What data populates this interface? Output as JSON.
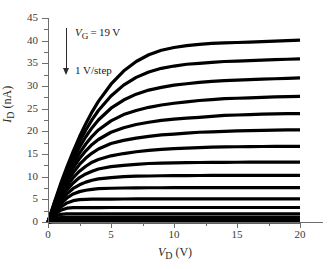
{
  "figure": {
    "background": "#ffffff",
    "curve_color": "#000000",
    "axis_color": "#6d6d6d"
  },
  "axes": {
    "ylabel_html": "<i>I</i><sub>D</sub> (nA)",
    "xlabel_html": "<i>V</i><sub>D</sub> (V)",
    "y_ticks": [
      "0",
      "5",
      "10",
      "15",
      "20",
      "25",
      "30",
      "35",
      "40",
      "45"
    ],
    "x_ticks": [
      "0",
      "5",
      "10",
      "15",
      "20"
    ]
  },
  "annotation": {
    "vg_html": "<i>V</i><sub>G</sub>&thinsp;=&thinsp;19&thinsp;V",
    "step_html": "1 V/step",
    "arrow": "down-arrow"
  },
  "chart_data": {
    "type": "line",
    "title": "",
    "xlabel": "V_D (V)",
    "ylabel": "I_D (nA)",
    "xlim": [
      0,
      20
    ],
    "ylim": [
      0,
      45
    ],
    "xticks": [
      0,
      5,
      10,
      15,
      20
    ],
    "yticks": [
      0,
      5,
      10,
      15,
      20,
      25,
      30,
      35,
      40,
      45
    ],
    "grid": false,
    "legend": "none",
    "annotations": [
      {
        "text": "V_G = 19 V",
        "x": 2.2,
        "y": 40.5
      },
      {
        "text": "1 V/step",
        "x": 2.2,
        "y": 33.5
      }
    ],
    "x": [
      0,
      0.5,
      1,
      1.5,
      2,
      2.5,
      3,
      3.5,
      4,
      5,
      6,
      7,
      8,
      9,
      10,
      11,
      12,
      13,
      14,
      15,
      16,
      17,
      18,
      19,
      20
    ],
    "series": [
      {
        "name": "V_G = 19 V",
        "saturation": 40.1,
        "values": [
          0,
          4.3,
          8.4,
          12.1,
          15.6,
          18.8,
          21.7,
          24.3,
          26.6,
          30.4,
          33.3,
          35.4,
          36.9,
          37.9,
          38.5,
          38.9,
          39.2,
          39.4,
          39.5,
          39.6,
          39.7,
          39.8,
          39.9,
          40.0,
          40.1
        ]
      },
      {
        "name": "V_G = 18 V",
        "saturation": 36.0,
        "values": [
          0,
          4.1,
          8.0,
          11.6,
          14.8,
          17.7,
          20.3,
          22.6,
          24.6,
          27.8,
          30.2,
          31.9,
          33.1,
          33.9,
          34.4,
          34.8,
          35.0,
          35.2,
          35.4,
          35.5,
          35.6,
          35.7,
          35.8,
          35.9,
          36.0
        ]
      },
      {
        "name": "V_G = 17 V",
        "saturation": 31.8,
        "values": [
          0,
          3.9,
          7.6,
          10.9,
          13.9,
          16.5,
          18.8,
          20.8,
          22.5,
          25.1,
          26.9,
          28.2,
          29.1,
          29.7,
          30.2,
          30.5,
          30.8,
          31.0,
          31.2,
          31.3,
          31.4,
          31.5,
          31.6,
          31.7,
          31.8
        ]
      },
      {
        "name": "V_G = 16 V",
        "saturation": 27.7,
        "values": [
          0,
          3.7,
          7.1,
          10.2,
          12.9,
          15.2,
          17.2,
          18.9,
          20.3,
          22.3,
          23.7,
          24.6,
          25.3,
          25.8,
          26.2,
          26.5,
          26.8,
          27.0,
          27.2,
          27.3,
          27.4,
          27.5,
          27.6,
          27.65,
          27.7
        ]
      },
      {
        "name": "V_G = 15 V",
        "saturation": 23.9,
        "values": [
          0,
          3.5,
          6.7,
          9.5,
          12.0,
          14.0,
          15.7,
          17.1,
          18.2,
          19.8,
          20.8,
          21.5,
          22.0,
          22.4,
          22.7,
          22.9,
          23.1,
          23.3,
          23.5,
          23.6,
          23.7,
          23.8,
          23.85,
          23.9,
          23.9
        ]
      },
      {
        "name": "V_G = 14 V",
        "saturation": 20.3,
        "values": [
          0,
          3.3,
          6.2,
          8.8,
          10.9,
          12.7,
          14.1,
          15.2,
          16.1,
          17.3,
          18.0,
          18.5,
          18.9,
          19.2,
          19.4,
          19.6,
          19.8,
          19.9,
          20.0,
          20.1,
          20.15,
          20.2,
          20.25,
          20.3,
          20.3
        ]
      },
      {
        "name": "V_G = 13 V",
        "saturation": 16.7,
        "values": [
          0,
          3.0,
          5.7,
          7.9,
          9.8,
          11.2,
          12.3,
          13.2,
          13.8,
          14.6,
          15.1,
          15.5,
          15.8,
          16.0,
          16.2,
          16.3,
          16.4,
          16.5,
          16.55,
          16.6,
          16.62,
          16.65,
          16.67,
          16.7,
          16.7
        ]
      },
      {
        "name": "V_G = 12 V",
        "saturation": 13.2,
        "values": [
          0,
          2.8,
          5.2,
          7.1,
          8.6,
          9.8,
          10.6,
          11.2,
          11.7,
          12.2,
          12.5,
          12.7,
          12.9,
          13.0,
          13.05,
          13.1,
          13.12,
          13.14,
          13.16,
          13.18,
          13.19,
          13.2,
          13.2,
          13.2,
          13.2
        ]
      },
      {
        "name": "V_G = 11 V",
        "saturation": 10.3,
        "values": [
          0,
          2.5,
          4.6,
          6.2,
          7.4,
          8.2,
          8.8,
          9.2,
          9.5,
          9.8,
          10.0,
          10.1,
          10.15,
          10.2,
          10.22,
          10.24,
          10.26,
          10.27,
          10.28,
          10.29,
          10.3,
          10.3,
          10.3,
          10.3,
          10.3
        ]
      },
      {
        "name": "V_G = 10 V",
        "saturation": 7.6,
        "values": [
          0,
          2.2,
          4.0,
          5.3,
          6.2,
          6.7,
          7.0,
          7.2,
          7.35,
          7.45,
          7.5,
          7.53,
          7.55,
          7.56,
          7.57,
          7.58,
          7.58,
          7.59,
          7.59,
          7.6,
          7.6,
          7.6,
          7.6,
          7.6,
          7.6
        ]
      },
      {
        "name": "V_G = 9 V",
        "saturation": 5.1,
        "values": [
          0,
          1.9,
          3.3,
          4.2,
          4.7,
          4.95,
          5.0,
          5.03,
          5.05,
          5.06,
          5.07,
          5.08,
          5.08,
          5.09,
          5.09,
          5.1,
          5.1,
          5.1,
          5.1,
          5.1,
          5.1,
          5.1,
          5.1,
          5.1,
          5.1
        ]
      },
      {
        "name": "V_G = 8 V",
        "saturation": 3.2,
        "values": [
          0,
          1.6,
          2.6,
          3.05,
          3.15,
          3.17,
          3.18,
          3.19,
          3.19,
          3.2,
          3.2,
          3.2,
          3.2,
          3.2,
          3.2,
          3.2,
          3.2,
          3.2,
          3.2,
          3.2,
          3.2,
          3.2,
          3.2,
          3.2,
          3.2
        ]
      },
      {
        "name": "V_G = 7 V",
        "saturation": 1.8,
        "values": [
          0,
          1.2,
          1.7,
          1.78,
          1.79,
          1.8,
          1.8,
          1.8,
          1.8,
          1.8,
          1.8,
          1.8,
          1.8,
          1.8,
          1.8,
          1.8,
          1.8,
          1.8,
          1.8,
          1.8,
          1.8,
          1.8,
          1.8,
          1.8,
          1.8
        ]
      },
      {
        "name": "V_G = 6 V",
        "saturation": 1.0,
        "values": [
          0,
          0.8,
          0.98,
          1.0,
          1.0,
          1.0,
          1.0,
          1.0,
          1.0,
          1.0,
          1.0,
          1.0,
          1.0,
          1.0,
          1.0,
          1.0,
          1.0,
          1.0,
          1.0,
          1.0,
          1.0,
          1.0,
          1.0,
          1.0,
          1.0
        ]
      },
      {
        "name": "V_G = 5 V",
        "saturation": 0.62,
        "values": [
          0,
          0.55,
          0.61,
          0.62,
          0.62,
          0.62,
          0.62,
          0.62,
          0.62,
          0.62,
          0.62,
          0.62,
          0.62,
          0.62,
          0.62,
          0.62,
          0.62,
          0.62,
          0.62,
          0.62,
          0.62,
          0.62,
          0.62,
          0.62,
          0.62
        ]
      },
      {
        "name": "V_G = 4 V",
        "saturation": 0.42,
        "values": [
          0,
          0.38,
          0.42,
          0.42,
          0.42,
          0.42,
          0.42,
          0.42,
          0.42,
          0.42,
          0.42,
          0.42,
          0.42,
          0.42,
          0.42,
          0.42,
          0.42,
          0.42,
          0.42,
          0.42,
          0.42,
          0.42,
          0.42,
          0.42,
          0.42
        ]
      },
      {
        "name": "V_G = 3 V",
        "saturation": 0.28,
        "values": [
          0,
          0.26,
          0.28,
          0.28,
          0.28,
          0.28,
          0.28,
          0.28,
          0.28,
          0.28,
          0.28,
          0.28,
          0.28,
          0.28,
          0.28,
          0.28,
          0.28,
          0.28,
          0.28,
          0.28,
          0.28,
          0.28,
          0.28,
          0.28,
          0.28
        ]
      },
      {
        "name": "V_G = 2 V",
        "saturation": 0.18,
        "values": [
          0,
          0.17,
          0.18,
          0.18,
          0.18,
          0.18,
          0.18,
          0.18,
          0.18,
          0.18,
          0.18,
          0.18,
          0.18,
          0.18,
          0.18,
          0.18,
          0.18,
          0.18,
          0.18,
          0.18,
          0.18,
          0.18,
          0.18,
          0.18,
          0.18
        ]
      },
      {
        "name": "V_G = 1 V",
        "saturation": 0.1,
        "values": [
          0,
          0.09,
          0.1,
          0.1,
          0.1,
          0.1,
          0.1,
          0.1,
          0.1,
          0.1,
          0.1,
          0.1,
          0.1,
          0.1,
          0.1,
          0.1,
          0.1,
          0.1,
          0.1,
          0.1,
          0.1,
          0.1,
          0.1,
          0.1,
          0.1
        ]
      },
      {
        "name": "V_G = 0 V",
        "saturation": 0.04,
        "values": [
          0,
          0.04,
          0.04,
          0.04,
          0.04,
          0.04,
          0.04,
          0.04,
          0.04,
          0.04,
          0.04,
          0.04,
          0.04,
          0.04,
          0.04,
          0.04,
          0.04,
          0.04,
          0.04,
          0.04,
          0.04,
          0.04,
          0.04,
          0.04,
          0.04
        ]
      }
    ]
  }
}
